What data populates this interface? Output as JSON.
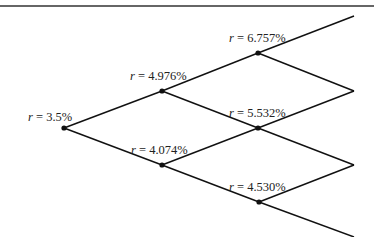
{
  "diagram": {
    "type": "binomial-interest-rate-tree",
    "colors": {
      "line": "#111111",
      "node": "#111111",
      "text": "#222222",
      "border": "#333333"
    },
    "top_border": {
      "y": 6
    },
    "nodes": [
      {
        "id": "n0",
        "x": 64,
        "y": 128,
        "label_var": "r",
        "label_eq": " = ",
        "label_val": "3.5%",
        "lx": 28,
        "ly": 121
      },
      {
        "id": "n1u",
        "x": 162,
        "y": 91,
        "label_var": "r",
        "label_eq": " = ",
        "label_val": "4.976%",
        "lx": 130,
        "ly": 80
      },
      {
        "id": "n1d",
        "x": 162,
        "y": 165,
        "label_var": "r",
        "label_eq": " = ",
        "label_val": "4.074%",
        "lx": 131,
        "ly": 154
      },
      {
        "id": "n2uu",
        "x": 258,
        "y": 53,
        "label_var": "r",
        "label_eq": " = ",
        "label_val": "6.757%",
        "lx": 229,
        "ly": 42
      },
      {
        "id": "n2ud",
        "x": 258,
        "y": 128,
        "label_var": "r",
        "label_eq": " = ",
        "label_val": "5.532%",
        "lx": 229,
        "ly": 117
      },
      {
        "id": "n2dd",
        "x": 259,
        "y": 202,
        "label_var": "r",
        "label_eq": " = ",
        "label_val": "4.530%",
        "lx": 229,
        "ly": 191
      }
    ],
    "terminals": [
      {
        "x": 354,
        "y": 16
      },
      {
        "x": 354,
        "y": 91
      },
      {
        "x": 354,
        "y": 165
      },
      {
        "x": 354,
        "y": 237
      }
    ],
    "edges": [
      [
        "n0",
        "n1u"
      ],
      [
        "n0",
        "n1d"
      ],
      [
        "n1u",
        "n2uu"
      ],
      [
        "n1u",
        "n2ud"
      ],
      [
        "n1d",
        "n2ud"
      ],
      [
        "n1d",
        "n2dd"
      ],
      [
        "n2uu",
        "t0"
      ],
      [
        "n2uu",
        "t1"
      ],
      [
        "n2ud",
        "t1"
      ],
      [
        "n2ud",
        "t2"
      ],
      [
        "n2dd",
        "t2"
      ],
      [
        "n2dd",
        "t3"
      ]
    ],
    "labels": {
      "n0": "r = 3.5%",
      "n1u": "r = 4.976%",
      "n1d": "r = 4.074%",
      "n2uu": "r = 6.757%",
      "n2ud": "r = 5.532%",
      "n2dd": "r = 4.530%"
    }
  }
}
